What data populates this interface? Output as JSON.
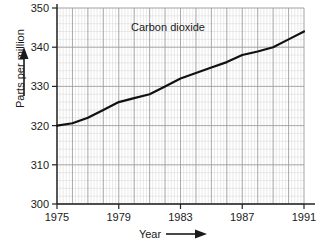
{
  "chart_data": {
    "type": "line",
    "title": "Carbon dioxide",
    "xlabel": "Year",
    "ylabel": "Parts per million",
    "xlim": [
      1975,
      1991
    ],
    "ylim": [
      300,
      350
    ],
    "grid": true,
    "legend": "none",
    "xticks": [
      "1975",
      "1979",
      "1983",
      "1987",
      "1991"
    ],
    "yticks": [
      "300",
      "310",
      "320",
      "330",
      "340",
      "350"
    ],
    "xtick_values": [
      1975,
      1979,
      1983,
      1987,
      1991
    ],
    "ytick_values": [
      300,
      310,
      320,
      330,
      340,
      350
    ],
    "minor_grid_x_step": 0.2,
    "minor_grid_y_step": 2,
    "series": [
      {
        "name": "Carbon dioxide",
        "color": "#111111",
        "x": [
          1975,
          1976,
          1977,
          1978,
          1979,
          1980,
          1981,
          1982,
          1983,
          1984,
          1985,
          1986,
          1987,
          1988,
          1989,
          1990,
          1991
        ],
        "values": [
          320.0,
          320.6,
          322.0,
          324.0,
          326.0,
          327.0,
          328.0,
          330.0,
          332.0,
          333.4,
          334.8,
          336.2,
          338.0,
          338.9,
          340.0,
          342.0,
          344.0
        ]
      }
    ],
    "annotations": {
      "x_axis_arrow": "right-arrow",
      "y_axis_arrow": "up-arrow"
    },
    "colors": {
      "line": "#111111",
      "axis": "#222222",
      "major_grid": "#9a9a9a",
      "minor_grid": "#dcdcdc",
      "text": "#1a1a1a",
      "background": "#ffffff"
    }
  }
}
